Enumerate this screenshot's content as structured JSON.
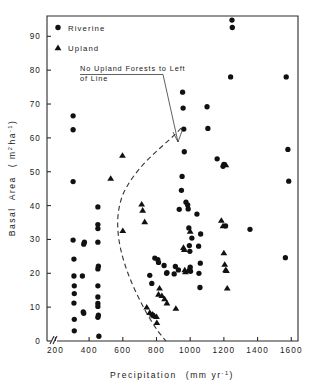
{
  "figure": {
    "background": "#ffffff",
    "ink": "#111111"
  },
  "legend": {
    "items": [
      {
        "label": "Riverine",
        "marker": "circle",
        "icon": "filled-circle-icon"
      },
      {
        "label": "Upland",
        "marker": "triangle",
        "icon": "filled-triangle-icon"
      }
    ]
  },
  "annotation": {
    "line1": "No Upland Forests to Left",
    "line2": "of Line"
  },
  "chart_data": {
    "type": "scatter",
    "title": "",
    "xlabel": "Precipitation  (mm yr⁻¹)",
    "ylabel": "Basal  Area   ( m² ha⁻¹ )",
    "xlabel_text": "Precipitation",
    "xlabel_units": "(mm yr-1)",
    "ylabel_text": "Basal Area",
    "ylabel_units": "(m2 ha-1)",
    "xlim": [
      150,
      1640
    ],
    "ylim": [
      0,
      96
    ],
    "xticks": [
      200,
      400,
      600,
      800,
      1000,
      1200,
      1400,
      1600
    ],
    "yticks": [
      0,
      10,
      20,
      30,
      40,
      50,
      60,
      70,
      80,
      90
    ],
    "xtick_labels": [
      "200",
      "400",
      "600",
      "800",
      "1000",
      "1200",
      "1400",
      "1600"
    ],
    "ytick_labels": [
      "0",
      "10",
      "20",
      "30",
      "40",
      "50",
      "60",
      "70",
      "80",
      "90"
    ],
    "grid": false,
    "axis_break": true,
    "legend_position": "top-left-inside",
    "series": [
      {
        "name": "Riverine",
        "marker": "circle",
        "color": "#111111",
        "points": [
          [
            305,
            66.5
          ],
          [
            305,
            62.4
          ],
          [
            305,
            47.1
          ],
          [
            305,
            29.8
          ],
          [
            310,
            24.2
          ],
          [
            310,
            19.2
          ],
          [
            312,
            16.3
          ],
          [
            312,
            14.0
          ],
          [
            310,
            11.2
          ],
          [
            312,
            6.4
          ],
          [
            312,
            3.0
          ],
          [
            360,
            19.2
          ],
          [
            368,
            28.6
          ],
          [
            372,
            29.2
          ],
          [
            365,
            8.6
          ],
          [
            368,
            8.2
          ],
          [
            452,
            39.6
          ],
          [
            452,
            34.4
          ],
          [
            452,
            33.2
          ],
          [
            452,
            29.2
          ],
          [
            455,
            22.1
          ],
          [
            452,
            21.3
          ],
          [
            452,
            16.3
          ],
          [
            452,
            13.0
          ],
          [
            452,
            11.1
          ],
          [
            452,
            10.2
          ],
          [
            455,
            7.6
          ],
          [
            452,
            7.0
          ],
          [
            458,
            1.4
          ],
          [
            760,
            19.4
          ],
          [
            772,
            17.0
          ],
          [
            790,
            24.5
          ],
          [
            808,
            24.0
          ],
          [
            812,
            23.2
          ],
          [
            845,
            22.3
          ],
          [
            860,
            20.0
          ],
          [
            862,
            20.2
          ],
          [
            905,
            19.8
          ],
          [
            912,
            22.0
          ],
          [
            930,
            21.0
          ],
          [
            935,
            38.9
          ],
          [
            948,
            44.5
          ],
          [
            952,
            48.6
          ],
          [
            955,
            73.5
          ],
          [
            958,
            68.8
          ],
          [
            962,
            62.6
          ],
          [
            965,
            55.9
          ],
          [
            975,
            41.0
          ],
          [
            985,
            40.2
          ],
          [
            988,
            39.0
          ],
          [
            992,
            33.4
          ],
          [
            995,
            28.2
          ],
          [
            998,
            26.5
          ],
          [
            1000,
            21.8
          ],
          [
            1002,
            20.6
          ],
          [
            1010,
            30.4
          ],
          [
            1040,
            37.5
          ],
          [
            1050,
            28.0
          ],
          [
            1052,
            20.0
          ],
          [
            1058,
            15.8
          ],
          [
            1060,
            23.0
          ],
          [
            1062,
            31.6
          ],
          [
            1100,
            69.2
          ],
          [
            1105,
            62.8
          ],
          [
            1160,
            53.8
          ],
          [
            1195,
            51.6
          ],
          [
            1200,
            52.2
          ],
          [
            1210,
            34.0
          ],
          [
            1240,
            78.0
          ],
          [
            1248,
            94.8
          ],
          [
            1250,
            92.6
          ],
          [
            1355,
            33.0
          ],
          [
            1570,
            78.0
          ],
          [
            1580,
            56.6
          ],
          [
            1585,
            47.2
          ],
          [
            1565,
            24.6
          ]
        ]
      },
      {
        "name": "Upland",
        "marker": "triangle",
        "color": "#111111",
        "points": [
          [
            528,
            48.0
          ],
          [
            598,
            54.8
          ],
          [
            600,
            32.6
          ],
          [
            712,
            40.4
          ],
          [
            718,
            38.6
          ],
          [
            730,
            35.2
          ],
          [
            742,
            10.0
          ],
          [
            760,
            8.4
          ],
          [
            775,
            7.9
          ],
          [
            782,
            7.6
          ],
          [
            788,
            7.4
          ],
          [
            800,
            7.2
          ],
          [
            802,
            5.4
          ],
          [
            812,
            13.8
          ],
          [
            818,
            15.6
          ],
          [
            832,
            13.4
          ],
          [
            848,
            12.4
          ],
          [
            862,
            11.2
          ],
          [
            915,
            9.6
          ],
          [
            960,
            27.6
          ],
          [
            965,
            27.0
          ],
          [
            968,
            21.0
          ],
          [
            972,
            20.4
          ],
          [
            988,
            20.8
          ],
          [
            1000,
            32.4
          ],
          [
            1185,
            35.6
          ],
          [
            1195,
            34.0
          ],
          [
            1200,
            26.0
          ],
          [
            1205,
            22.6
          ],
          [
            1210,
            21.0
          ],
          [
            1215,
            20.8
          ],
          [
            1220,
            15.6
          ],
          [
            1212,
            52.0
          ]
        ]
      }
    ]
  }
}
